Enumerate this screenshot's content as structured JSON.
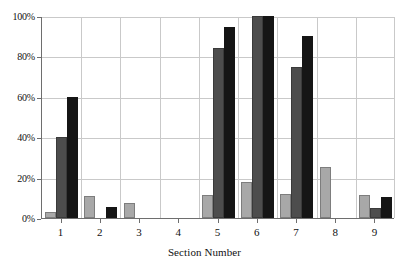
{
  "chart_data": {
    "type": "bar",
    "title": "",
    "xlabel": "Section Number",
    "ylabel": "",
    "categories": [
      "1",
      "2",
      "3",
      "4",
      "5",
      "6",
      "7",
      "8",
      "9"
    ],
    "ylim": [
      0,
      100
    ],
    "yticks": [
      0,
      20,
      40,
      60,
      80,
      100
    ],
    "ytick_labels": [
      "0%",
      "20%",
      "40%",
      "60%",
      "80%",
      "100%"
    ],
    "grid": "horizontal-and-vertical",
    "legend": "none",
    "series": [
      {
        "name": "series-1",
        "color": "#a8a8a8",
        "values": [
          3,
          11,
          7.5,
          0,
          11.5,
          18,
          12,
          25.5,
          11.5
        ]
      },
      {
        "name": "series-2",
        "color": "#4d4d4d",
        "values": [
          40,
          0,
          0,
          0,
          84,
          100,
          75,
          0,
          5
        ]
      },
      {
        "name": "series-3",
        "color": "#151515",
        "values": [
          60,
          5.5,
          0,
          0,
          94.5,
          100,
          90,
          0,
          10.5
        ]
      }
    ]
  },
  "axes": {
    "y_unit": "%",
    "x_title": "Section Number"
  }
}
